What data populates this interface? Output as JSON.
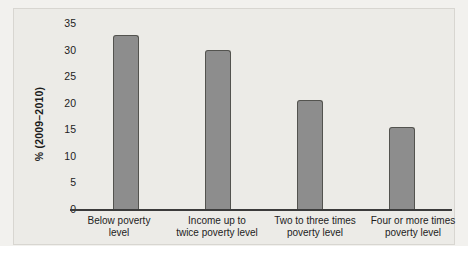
{
  "chart_data": {
    "type": "bar",
    "title": "",
    "xlabel": "",
    "ylabel": "% (2009–2010)",
    "categories": [
      "Below poverty level",
      "Income up to twice poverty level",
      "Two to three times poverty level",
      "Four or more times poverty level"
    ],
    "values": [
      32.8,
      30.0,
      20.6,
      15.5
    ],
    "ylim": [
      0,
      35
    ],
    "yticks": [
      0,
      5,
      10,
      15,
      20,
      25,
      30,
      35
    ],
    "ytick_labels": [
      "0",
      "5",
      "10",
      "15",
      "20",
      "25",
      "30",
      "35"
    ],
    "grid": false,
    "legend": null,
    "series": [
      {
        "name": "% (2009–2010)",
        "values": [
          32.8,
          30.0,
          20.6,
          15.5
        ]
      }
    ]
  },
  "style": {
    "bar_fill": "#8d8d8d",
    "bar_border": "#53534f",
    "panel_background": "#ecebe7",
    "panel_border": "#d8d6d1",
    "axis_color": "#3b3b3b",
    "text_color": "#1c1c1c",
    "page_background": "#ffffff"
  },
  "category_label_lines": [
    [
      "Below poverty",
      "level"
    ],
    [
      "Income up to",
      "twice poverty level"
    ],
    [
      "Two to three times",
      "poverty level"
    ],
    [
      "Four or more times",
      "poverty level"
    ]
  ]
}
